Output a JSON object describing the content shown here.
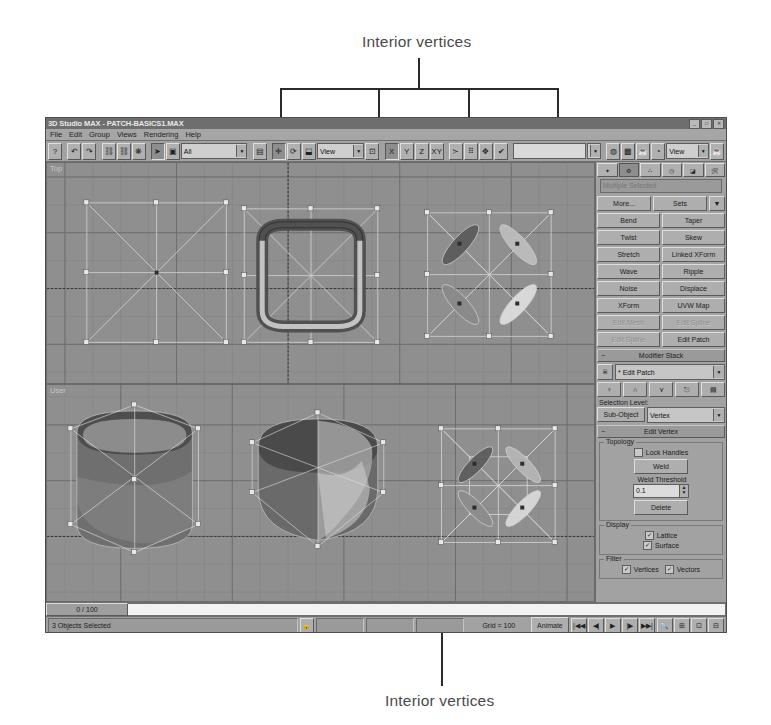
{
  "annotations": {
    "top": "Interior vertices",
    "bottom": "Interior vertices"
  },
  "window": {
    "title": "3D Studio MAX - PATCH-BASICS1.MAX",
    "buttons": {
      "minimize": "_",
      "maximize": "□",
      "close": "✕"
    }
  },
  "menu": [
    "File",
    "Edit",
    "Group",
    "Views",
    "Rendering",
    "Help"
  ],
  "toolbar": {
    "icons_left": [
      "help-icon",
      "undo-icon",
      "redo-icon",
      "link-icon",
      "unlink-icon",
      "bind-space-warp-icon",
      "select-object-icon",
      "select-region-icon"
    ],
    "selection_filter": "All",
    "icons_mid": [
      "select-by-name-icon",
      "select-and-move-icon",
      "select-and-rotate-icon",
      "select-and-scale-icon"
    ],
    "reference_coord": "View",
    "icons_axis": [
      "use-pivot-icon"
    ],
    "axis_constraints": [
      "X",
      "Y",
      "Z",
      "XY"
    ],
    "icons_right": [
      "mirror-icon",
      "array-icon",
      "align-icon",
      "snap-icon"
    ],
    "named_selection": "",
    "icons_far_right": [
      "material-editor-icon",
      "render-scene-icon",
      "quick-render-icon",
      "render-type-icon"
    ],
    "render_type": "View",
    "icons_end": [
      "render-last-icon"
    ]
  },
  "viewports": [
    {
      "label": "Top"
    },
    {
      "label": "User"
    }
  ],
  "command_panel": {
    "tabs": [
      "create-tab",
      "modify-tab",
      "hierarchy-tab",
      "motion-tab",
      "display-tab",
      "utilities-tab"
    ],
    "selected_tab_index": 1,
    "object_name": "Multiple Selected",
    "more_button": "More...",
    "sets_button": "Sets",
    "sets_arrow": "▼",
    "modifier_buttons": [
      {
        "label": "Bend",
        "disabled": false
      },
      {
        "label": "Taper",
        "disabled": false
      },
      {
        "label": "Twist",
        "disabled": false
      },
      {
        "label": "Skew",
        "disabled": false
      },
      {
        "label": "Stretch",
        "disabled": false
      },
      {
        "label": "Linked XForm",
        "disabled": false
      },
      {
        "label": "Wave",
        "disabled": false
      },
      {
        "label": "Ripple",
        "disabled": false
      },
      {
        "label": "Noise",
        "disabled": false
      },
      {
        "label": "Displace",
        "disabled": false
      },
      {
        "label": "XForm",
        "disabled": false
      },
      {
        "label": "UVW Map",
        "disabled": false
      },
      {
        "label": "Edit Mesh",
        "disabled": true
      },
      {
        "label": "Edit Spline",
        "disabled": true
      },
      {
        "label": "Edit Spline",
        "disabled": true
      },
      {
        "label": "Edit Patch",
        "disabled": false
      }
    ],
    "modifier_stack": {
      "rollout_title": "Modifier Stack",
      "rollout_marker": "−",
      "current": "* Edit Patch",
      "combo_arrow": "▼",
      "stack_icon": "pin-stack-icon",
      "tool_icons": [
        "active-modifier-toggle-icon",
        "show-end-result-icon",
        "make-unique-icon",
        "remove-modifier-icon",
        "edit-stack-icon"
      ],
      "selection_level_label": "Selection Level:",
      "sub_object_button": "Sub-Object",
      "sub_object_level": "Vertex",
      "sub_object_arrow": "▼"
    },
    "edit_vertex": {
      "rollout_title": "Edit Vertex",
      "rollout_marker": "−",
      "topology_label": "Topology",
      "lock_handles_label": "Lock Handles",
      "lock_handles_checked": false,
      "weld_button": "Weld",
      "weld_threshold_label": "Weld Threshold",
      "weld_threshold_value": "0.1",
      "delete_button": "Delete",
      "display_label": "Display",
      "lattice_label": "Lattice",
      "lattice_checked": true,
      "surface_label": "Surface",
      "surface_checked": true,
      "filter_label": "Filter",
      "vertices_label": "Vertices",
      "vertices_checked": true,
      "vectors_label": "Vectors",
      "vectors_checked": true
    }
  },
  "timeline": {
    "range_label": "0 / 100"
  },
  "status": {
    "selection_text": "3 Objects Selected",
    "lock_icon": "lock-icon",
    "coord_x": "",
    "coord_y": "",
    "coord_z": "",
    "grid_label": "Grid = 100",
    "render_time": "Rendering Time  0:00:05"
  },
  "animation": {
    "animate_button": "Animate",
    "key_mode_icon": "key-mode-icon",
    "current_frame": "0",
    "time_config_icon": "time-configuration-icon",
    "playback_icons": [
      "go-to-start-icon",
      "previous-frame-icon",
      "play-icon",
      "next-frame-icon",
      "go-to-end-icon"
    ],
    "viewport_nav_icons": [
      "zoom-icon",
      "zoom-all-icon",
      "zoom-extents-icon",
      "zoom-extents-all-icon",
      "field-of-view-icon",
      "region-zoom-icon",
      "arc-rotate-icon",
      "pan-icon",
      "min-max-toggle-icon"
    ],
    "snap_icons": [
      "snap-toggle-icon",
      "angle-snap-icon",
      "percent-snap-icon",
      "spinner-snap-icon",
      "named-sel-copy-icon",
      "named-sel-paste-icon",
      "align-sel-icon"
    ]
  },
  "colors": {
    "window_bg": "#9a9a9a",
    "panel_bg": "#a2a2a2",
    "viewport_bg": "#8f8f8f",
    "title_bg": "#6e6e6e",
    "anno_ink": "#2b2b2b"
  }
}
